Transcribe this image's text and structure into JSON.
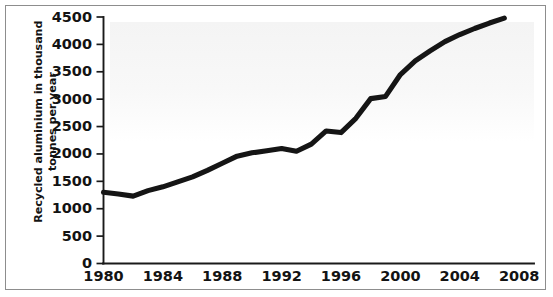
{
  "figure": {
    "kind": "line-chart",
    "frame_border_color": "#8d8d8d",
    "background_color": "#ffffff"
  },
  "chart_data": {
    "type": "line",
    "title": "",
    "subtitle": "",
    "xlabel": "",
    "ylabel": "Recycled aluminium in thousand\ntonnes per year",
    "ylabel_lines": [
      "Recycled aluminium in thousand",
      "tonnes per year"
    ],
    "series_color": "#151515",
    "grid": false,
    "legend": false,
    "legend_position": "none",
    "xlim": [
      1980,
      2009
    ],
    "ylim": [
      0,
      4500
    ],
    "yticks": [
      0,
      500,
      1000,
      1500,
      2000,
      2500,
      3000,
      3500,
      4000,
      4500
    ],
    "ytick_labels": [
      "0",
      "500",
      "1000",
      "1500",
      "2000",
      "2500",
      "3000",
      "3500",
      "4000",
      "4500"
    ],
    "xticks": [
      1980,
      1984,
      1988,
      1992,
      1996,
      2000,
      2004,
      2008
    ],
    "xtick_labels": [
      "1980",
      "1984",
      "1988",
      "1992",
      "1996",
      "2000",
      "2004",
      "2008"
    ],
    "x": [
      1980,
      1981,
      1982,
      1983,
      1984,
      1985,
      1986,
      1987,
      1988,
      1989,
      1990,
      1991,
      1992,
      1993,
      1994,
      1995,
      1996,
      1997,
      1998,
      1999,
      2000,
      2001,
      2002,
      2003,
      2004,
      2005,
      2006,
      2007
    ],
    "values": [
      1300,
      1270,
      1230,
      1330,
      1400,
      1490,
      1580,
      1700,
      1830,
      1960,
      2020,
      2060,
      2100,
      2050,
      2180,
      2420,
      2390,
      2650,
      3010,
      3050,
      3450,
      3700,
      3880,
      4050,
      4180,
      4290,
      4390,
      4480
    ],
    "series": [
      {
        "name": "Recycled aluminium",
        "values": [
          1300,
          1270,
          1230,
          1330,
          1400,
          1490,
          1580,
          1700,
          1830,
          1960,
          2020,
          2060,
          2100,
          2050,
          2180,
          2420,
          2390,
          2650,
          3010,
          3050,
          3450,
          3700,
          3880,
          4050,
          4180,
          4290,
          4390,
          4480
        ]
      }
    ]
  }
}
